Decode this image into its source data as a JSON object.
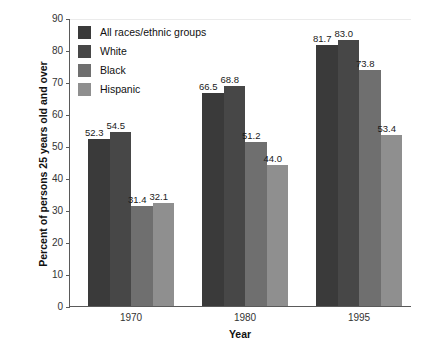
{
  "chart_data": {
    "type": "bar",
    "title": "",
    "subtitle": "",
    "xlabel": "Year",
    "ylabel": "Percent of persons 25 years old and over",
    "categories": [
      "1970",
      "1980",
      "1995"
    ],
    "series": [
      {
        "name": "All races/ethnic groups",
        "color": "#3a3a3a",
        "values": [
          52.3,
          66.5,
          81.7
        ],
        "labels": [
          "52.3",
          "66.5",
          "81.7"
        ]
      },
      {
        "name": "White",
        "color": "#474747",
        "values": [
          54.5,
          68.8,
          83.0
        ],
        "labels": [
          "54.5",
          "68.8",
          "83.0"
        ]
      },
      {
        "name": "Black",
        "color": "#6f6f6f",
        "values": [
          31.4,
          51.2,
          73.8
        ],
        "labels": [
          "31.4",
          "51.2",
          "73.8"
        ]
      },
      {
        "name": "Hispanic",
        "color": "#8f8f8f",
        "values": [
          32.1,
          44.0,
          53.4
        ],
        "labels": [
          "32.1",
          "44.0",
          "53.4"
        ]
      }
    ],
    "ylim": [
      0,
      90
    ],
    "ytick_step": 10,
    "yticks": [
      "0",
      "10",
      "20",
      "30",
      "40",
      "50",
      "60",
      "70",
      "80",
      "90"
    ],
    "grid": false,
    "legend_position": "upper-left-inside",
    "axis_color": "#5a5a5a",
    "background": "#ffffff"
  }
}
